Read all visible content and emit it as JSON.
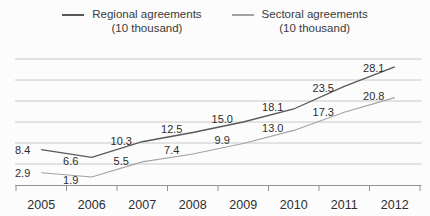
{
  "legend": {
    "items": [
      {
        "label": "Regional agreements",
        "unit": "(10 thousand)",
        "color": "#585858"
      },
      {
        "label": "Sectoral agreements",
        "unit": "(10 thousand)",
        "color": "#a3a3a3"
      }
    ]
  },
  "chart_data": {
    "type": "line",
    "categories": [
      "2005",
      "2006",
      "2007",
      "2008",
      "2009",
      "2010",
      "2011",
      "2012"
    ],
    "series": [
      {
        "name": "Regional agreements (10 thousand)",
        "slug": "regional-agreements",
        "values": [
          8.4,
          6.6,
          10.3,
          12.5,
          15.0,
          18.1,
          23.5,
          28.1
        ],
        "color": "#585858",
        "stroke_width": 1.3
      },
      {
        "name": "Sectoral agreements (10 thousand)",
        "slug": "sectoral-agreements",
        "values": [
          2.9,
          1.9,
          5.5,
          7.4,
          9.9,
          13.0,
          17.3,
          20.8
        ],
        "color": "#a3a3a3",
        "stroke_width": 1.1
      }
    ],
    "xlabel": "",
    "ylabel": "",
    "title": "",
    "ylim": [
      0,
      30
    ],
    "gridline_step": 5,
    "grid": true,
    "data_labels": true,
    "legend_position": "top",
    "axis_color": "#929292",
    "grid_color": "#bcbcbc",
    "text_color": "#2e2e2e"
  }
}
